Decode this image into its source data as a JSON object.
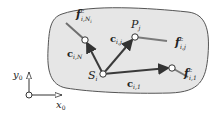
{
  "diagram": {
    "region": {
      "fill": "#e8e8e8",
      "stroke": "#555555"
    },
    "nodes": {
      "S": {
        "label": "S",
        "sub": "i"
      },
      "P": {
        "label": "P",
        "sub": "j"
      }
    },
    "vectors": {
      "c_iN": {
        "label": "c",
        "sub": "i,N"
      },
      "c_ij": {
        "label": "c",
        "sub": "i,j"
      },
      "c_i1": {
        "label": "c",
        "sub": "i,1"
      }
    },
    "forces": {
      "f_iNi": {
        "label": "f",
        "sup": "c",
        "sub": "i,N",
        "subsub": "i"
      },
      "f_ij": {
        "label": "f",
        "sup": "c",
        "sub": "i,j"
      },
      "f_i1": {
        "label": "f",
        "sup": "c",
        "sub": "i,1"
      }
    },
    "axes": {
      "x": {
        "label": "x",
        "sub": "0"
      },
      "y": {
        "label": "y",
        "sub": "0"
      }
    },
    "colors": {
      "vector": "#3a3a3a",
      "force": "#777777",
      "node_fill": "#ffffff"
    }
  }
}
